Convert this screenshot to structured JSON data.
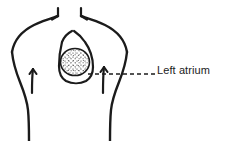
{
  "figure": {
    "kind": "anatomical-line-drawing",
    "background_color": "#ffffff",
    "ink_color": "#1b1b1b",
    "width": 225,
    "height": 141
  },
  "callout": {
    "label": "Left atrium",
    "label_x": 157,
    "label_y": 64,
    "font_size": 11,
    "leader_line": {
      "style": "dashed",
      "color": "#1b1b1b",
      "x_start": 88,
      "x_end": 155,
      "y": 74,
      "dash_pattern": "4 3"
    }
  },
  "structures": {
    "torso": {
      "name": "torso-outline",
      "stroke_width": 2.2
    },
    "shoulder_left": {
      "name": "left-shoulder-curve",
      "arrowhead": "up-right"
    },
    "shoulder_right": {
      "name": "right-shoulder-curve",
      "arrowhead": "up-left"
    },
    "arrow_left_flank": {
      "name": "left-flank-arrow",
      "direction": "up"
    },
    "arrow_right_flank": {
      "name": "right-flank-arrow",
      "direction": "up"
    },
    "heart": {
      "name": "heart-outline",
      "stroke_width": 2.0
    },
    "left_atrium": {
      "name": "left-atrium-region",
      "fill": "stipple",
      "center_x": 75,
      "center_y": 62,
      "radius": 14
    }
  }
}
